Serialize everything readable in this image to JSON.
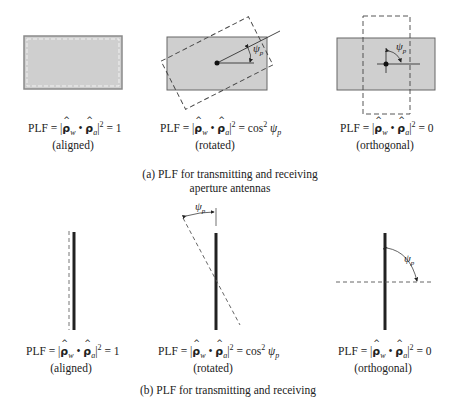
{
  "figure": {
    "part_a": {
      "caption_line1": "(a) PLF for transmitting and receiving",
      "caption_line2": "aperture antennas",
      "panels": [
        {
          "id": "aligned",
          "lhs": "PLF = |",
          "rho_w": "ρ",
          "w_sub": "w",
          "dot": " • ",
          "rho_a": "ρ",
          "a_sub": "a",
          "rhs_exp": "2",
          "rhs": " = 1",
          "state": "(aligned)"
        },
        {
          "id": "rotated",
          "lhs": "PLF = |",
          "rho_w": "ρ",
          "w_sub": "w",
          "dot": " • ",
          "rho_a": "ρ",
          "a_sub": "a",
          "rhs_exp": "2",
          "rhs": " = cos",
          "cos_exp": "2",
          "psi": " ψ",
          "psi_sub": "p",
          "state": "(rotated)"
        },
        {
          "id": "orthogonal",
          "lhs": "PLF = |",
          "rho_w": "ρ",
          "w_sub": "w",
          "dot": " • ",
          "rho_a": "ρ",
          "a_sub": "a",
          "rhs_exp": "2",
          "rhs": " = 0",
          "state": "(orthogonal)"
        }
      ]
    },
    "part_b": {
      "caption_line1": "(b) PLF for transmitting and receiving",
      "panels": [
        {
          "id": "aligned",
          "lhs": "PLF = |",
          "rho_w": "ρ",
          "w_sub": "w",
          "dot": " • ",
          "rho_a": "ρ",
          "a_sub": "a",
          "rhs_exp": "2",
          "rhs": " = 1",
          "state": "(aligned)"
        },
        {
          "id": "rotated",
          "lhs": "PLF = |",
          "rho_w": "ρ",
          "w_sub": "w",
          "dot": " • ",
          "rho_a": "ρ",
          "a_sub": "a",
          "rhs_exp": "2",
          "rhs": " = cos",
          "cos_exp": "2",
          "psi": " ψ",
          "psi_sub": "p",
          "state": "(rotated)"
        },
        {
          "id": "orthogonal",
          "lhs": "PLF = |",
          "rho_w": "ρ",
          "w_sub": "w",
          "dot": " • ",
          "rho_a": "ρ",
          "a_sub": "a",
          "rhs_exp": "2",
          "rhs": " = 0",
          "state": "(orthogonal)"
        }
      ]
    },
    "angle_symbol": "ψ",
    "angle_sub": "p",
    "colors": {
      "aperture_fill": "#cfcfcf",
      "aperture_stroke": "#8a8a8a",
      "line": "#222222",
      "dashed": "#555555"
    }
  }
}
